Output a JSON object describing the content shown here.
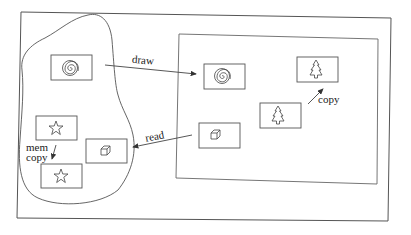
{
  "diagram": {
    "regions": {
      "outer_frame": {
        "label": ""
      },
      "memory_blob": {
        "label": ""
      },
      "screen": {
        "label": ""
      }
    },
    "items": [
      {
        "id": "mem-spiral",
        "icon": "spiral-icon",
        "region": "memory_blob"
      },
      {
        "id": "mem-star-1",
        "icon": "star-icon",
        "region": "memory_blob"
      },
      {
        "id": "mem-cube",
        "icon": "cube-icon",
        "region": "memory_blob"
      },
      {
        "id": "mem-star-2",
        "icon": "star-icon",
        "region": "memory_blob"
      },
      {
        "id": "screen-spiral",
        "icon": "spiral-icon",
        "region": "screen"
      },
      {
        "id": "screen-tree-1",
        "icon": "tree-icon",
        "region": "screen"
      },
      {
        "id": "screen-tree-2",
        "icon": "tree-icon",
        "region": "screen"
      },
      {
        "id": "screen-cube",
        "icon": "cube-icon",
        "region": "screen"
      }
    ],
    "arrows": [
      {
        "from": "mem-spiral",
        "to": "screen-spiral",
        "label": "draw"
      },
      {
        "from": "screen-cube",
        "to": "mem-cube",
        "label": "read"
      },
      {
        "from": "screen-tree-2",
        "to": "screen-tree-1",
        "label": "copy"
      },
      {
        "from": "mem-star-1",
        "to": "mem-star-2",
        "label_line1": "mem",
        "label_line2": "copy"
      }
    ],
    "colors": {
      "stroke": "#444444",
      "background": "#ffffff"
    }
  }
}
